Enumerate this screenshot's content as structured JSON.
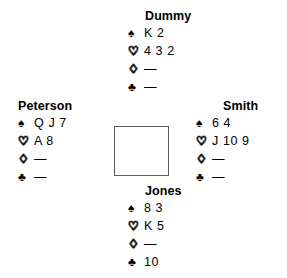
{
  "diagram": {
    "type": "bridge-hand-diagram",
    "suit_symbols": {
      "spade": "♠",
      "heart": "♡",
      "diamond": "♢",
      "club": "♣"
    },
    "void_marker": "—",
    "border_color": "#5a5a5a",
    "background_color": "#ffffff",
    "text_color": "#000000"
  },
  "hands": {
    "north": {
      "name": "Dummy",
      "spades": "K 2",
      "hearts": "4 3 2",
      "diamonds": "—",
      "clubs": "—"
    },
    "west": {
      "name": "Peterson",
      "spades": "Q J 7",
      "hearts": "A 8",
      "diamonds": "—",
      "clubs": "—"
    },
    "east": {
      "name": "Smith",
      "spades": "6 4",
      "hearts": "J 10 9",
      "diamonds": "—",
      "clubs": "—"
    },
    "south": {
      "name": "Jones",
      "spades": "8 3",
      "hearts": "K 5",
      "diamonds": "—",
      "clubs": "10"
    }
  }
}
